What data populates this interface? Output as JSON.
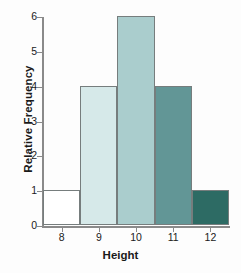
{
  "chart_data": {
    "type": "bar",
    "title": "",
    "xlabel": "Height",
    "ylabel": "Relative Frequency",
    "categories": [
      "8",
      "9",
      "10",
      "11",
      "12"
    ],
    "values": [
      1,
      4,
      6,
      4,
      1
    ],
    "ylim": [
      0,
      6
    ],
    "yticks": [
      "0",
      "1",
      "2",
      "3",
      "4",
      "5",
      "6"
    ],
    "xticks": [
      "8",
      "9",
      "10",
      "11",
      "12"
    ],
    "grid": false,
    "legend": "none",
    "bar_colors": [
      "#ffffff",
      "#d6e9e9",
      "#aacdcd",
      "#629696",
      "#2d6b64"
    ],
    "bar_edge_color": "#767d7d",
    "axis_color": "#8a8a8a",
    "text_color": "#1a1a1a"
  }
}
